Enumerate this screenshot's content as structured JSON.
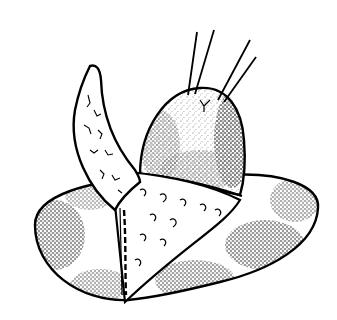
{
  "image": {
    "description": "Black-and-white stippled surgical illustration: a dome-shaped tissue mass with two pairs of traction sutures rising from its top, resting on an oval base; a curved textured flap folds up and over to the left, with a triangular textured wedge between flap and dome.",
    "colors": {
      "ink": "#000000",
      "paper": "#ffffff"
    }
  }
}
